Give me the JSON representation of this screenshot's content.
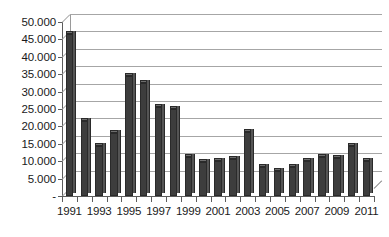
{
  "chart_data": {
    "type": "bar",
    "title": "",
    "subtitle": "",
    "xlabel": "",
    "ylabel": "",
    "grid": true,
    "legend": "none",
    "three_d": true,
    "ylim": [
      0,
      50000
    ],
    "ytick_step": 5000,
    "ytick_labels": [
      "-",
      "5.000",
      "10.000",
      "15.000",
      "20.000",
      "25.000",
      "30.000",
      "35.000",
      "40.000",
      "45.000",
      "50.000"
    ],
    "ytick_values": [
      0,
      5000,
      10000,
      15000,
      20000,
      25000,
      30000,
      35000,
      40000,
      45000,
      50000
    ],
    "categories": [
      "1991",
      "1992",
      "1993",
      "1994",
      "1995",
      "1996",
      "1997",
      "1998",
      "1999",
      "2000",
      "2001",
      "2002",
      "2003",
      "2004",
      "2005",
      "2006",
      "2007",
      "2008",
      "2009",
      "2010",
      "2011"
    ],
    "xtick_labels_shown": [
      "1991",
      "1993",
      "1995",
      "1997",
      "1999",
      "2001",
      "2003",
      "2005",
      "2007",
      "2009",
      "2011"
    ],
    "values": [
      46500,
      21500,
      14500,
      18000,
      34500,
      32500,
      25700,
      25000,
      11300,
      9900,
      10000,
      10700,
      18500,
      8200,
      7100,
      8200,
      10000,
      11100,
      11000,
      14300,
      10200
    ],
    "series": [
      {
        "name": "Series 1",
        "values": [
          46500,
          21500,
          14500,
          18000,
          34500,
          32500,
          25700,
          25000,
          11300,
          9900,
          10000,
          10700,
          18500,
          8200,
          7100,
          8200,
          10000,
          11100,
          11000,
          14300,
          10200
        ]
      }
    ],
    "colors": {
      "bar_face": "#3d3d3d",
      "bar_top": "#6e6e6e",
      "bar_side": "#555555",
      "gridline": "#a6a6a6",
      "axis": "#5d5d5d",
      "background": "#ffffff",
      "text": "#1a1a1a"
    }
  }
}
